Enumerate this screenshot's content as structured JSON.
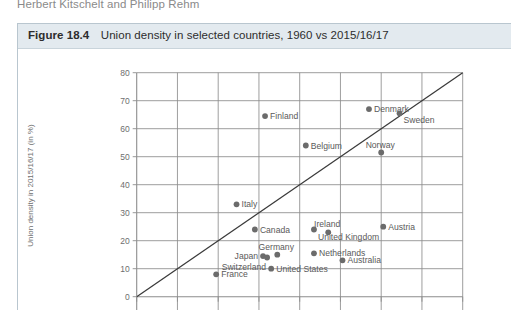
{
  "running_head": "Herbert Kitschelt and Philipp Rehm",
  "figure": {
    "number": "Figure 18.4",
    "caption": "Union density in selected countries, 1960 vs 2015/16/17"
  },
  "colors": {
    "caption_bar": "#e3eaef",
    "caption_border": "#c9d4db",
    "grid": "#8d8d8d",
    "marker": "#6b6b6b",
    "reference_line": "#3a3a3a",
    "label_text": "#5a5a5a",
    "tick_text": "#6e6e6e",
    "running_head": "#8a8a8a"
  },
  "chart_data": {
    "type": "scatter",
    "title": "Union density in selected countries, 1960 vs 2015/16/17",
    "xlabel": "Union density in 1960 (in %)",
    "ylabel": "Union density in 2015/16/17 (in %)",
    "xlim": [
      0,
      80
    ],
    "ylim": [
      0,
      80
    ],
    "xticks": [
      0,
      10,
      20,
      30,
      40,
      50,
      60,
      70,
      80
    ],
    "yticks": [
      0,
      10,
      20,
      30,
      40,
      50,
      60,
      70,
      80
    ],
    "ytick_labels": [
      "0",
      "10",
      "20",
      "30",
      "40",
      "50",
      "60",
      "70",
      "80"
    ],
    "xtick_labels": [
      "0",
      "10",
      "20",
      "30",
      "40",
      "50",
      "60",
      "70",
      "80"
    ],
    "grid": true,
    "legend": "none",
    "annotations": [
      {
        "text": "45-degree reference line",
        "from": [
          0,
          0
        ],
        "to": [
          80,
          80
        ]
      }
    ],
    "points": [
      {
        "label": "Finland",
        "x": 31.5,
        "y": 64.5,
        "label_pos": "right"
      },
      {
        "label": "Denmark",
        "x": 57.0,
        "y": 67.0,
        "label_pos": "right"
      },
      {
        "label": "Sweden",
        "x": 64.5,
        "y": 65.5,
        "label_pos": "right-below"
      },
      {
        "label": "Belgium",
        "x": 41.5,
        "y": 54.0,
        "label_pos": "right"
      },
      {
        "label": "Norway",
        "x": 60.0,
        "y": 51.5,
        "label_pos": "above"
      },
      {
        "label": "Italy",
        "x": 24.5,
        "y": 33.0,
        "label_pos": "right"
      },
      {
        "label": "Canada",
        "x": 29.0,
        "y": 24.0,
        "label_pos": "right"
      },
      {
        "label": "Ireland",
        "x": 47.0,
        "y": 23.0,
        "label_pos": "above"
      },
      {
        "label": "Austria",
        "x": 60.5,
        "y": 25.0,
        "label_pos": "right"
      },
      {
        "label": "United Kingdom",
        "x": 43.5,
        "y": 24.0,
        "label_pos": "right-below"
      },
      {
        "label": "Germany",
        "x": 34.5,
        "y": 15.0,
        "label_pos": "above"
      },
      {
        "label": "Japan",
        "x": 31.0,
        "y": 14.5,
        "label_pos": "left"
      },
      {
        "label": "Switzerland",
        "x": 32.0,
        "y": 14.0,
        "label_pos": "below-left"
      },
      {
        "label": "Netherlands",
        "x": 43.5,
        "y": 15.5,
        "label_pos": "right"
      },
      {
        "label": "Australia",
        "x": 50.5,
        "y": 13.0,
        "label_pos": "right"
      },
      {
        "label": "United States",
        "x": 33.0,
        "y": 10.0,
        "label_pos": "right"
      },
      {
        "label": "France",
        "x": 19.5,
        "y": 8.0,
        "label_pos": "right"
      }
    ]
  }
}
